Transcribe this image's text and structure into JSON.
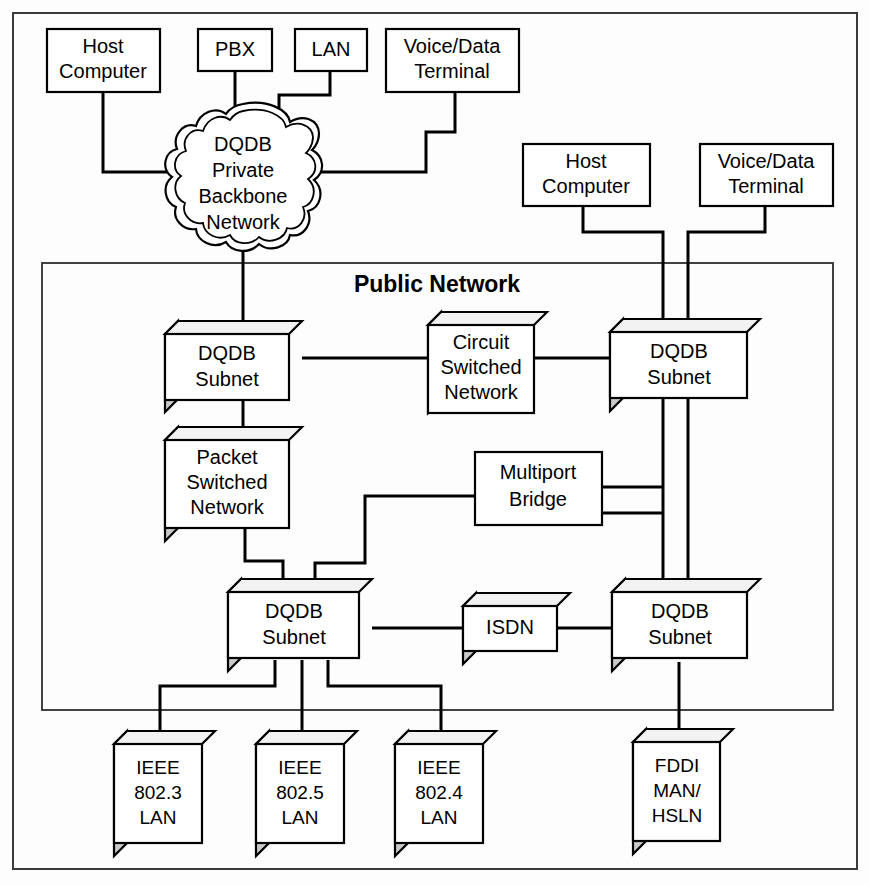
{
  "diagram": {
    "section_label": "Public Network",
    "nodes": {
      "host_computer_top": "Host\nComputer",
      "pbx": "PBX",
      "lan": "LAN",
      "voice_data_terminal_top": "Voice/Data\nTerminal",
      "dqdb_private_backbone": "DQDB\nPrivate\nBackbone\nNetwork",
      "host_computer_right": "Host\nComputer",
      "voice_data_terminal_right": "Voice/Data\nTerminal",
      "dqdb_subnet_1": "DQDB\nSubnet",
      "circuit_switched_network": "Circuit\nSwitched\nNetwork",
      "dqdb_subnet_2": "DQDB\nSubnet",
      "packet_switched_network": "Packet\nSwitched\nNetwork",
      "multiport_bridge": "Multiport\nBridge",
      "dqdb_subnet_3": "DQDB\nSubnet",
      "isdn": "ISDN",
      "dqdb_subnet_4": "DQDB\nSubnet",
      "ieee_802_3_lan": "IEEE\n802.3\nLAN",
      "ieee_802_5_lan": "IEEE\n802.5\nLAN",
      "ieee_802_4_lan": "IEEE\n802.4\nLAN",
      "fddi_man_hsln": "FDDI\nMAN/\nHSLN"
    },
    "node_lines": {
      "host_computer_top": [
        "Host",
        "Computer"
      ],
      "pbx": [
        "PBX"
      ],
      "lan": [
        "LAN"
      ],
      "voice_data_terminal_top": [
        "Voice/Data",
        "Terminal"
      ],
      "dqdb_private_backbone": [
        "DQDB",
        "Private",
        "Backbone",
        "Network"
      ],
      "host_computer_right": [
        "Host",
        "Computer"
      ],
      "voice_data_terminal_right": [
        "Voice/Data",
        "Terminal"
      ],
      "dqdb_subnet_1": [
        "DQDB",
        "Subnet"
      ],
      "circuit_switched_network": [
        "Circuit",
        "Switched",
        "Network"
      ],
      "dqdb_subnet_2": [
        "DQDB",
        "Subnet"
      ],
      "packet_switched_network": [
        "Packet",
        "Switched",
        "Network"
      ],
      "multiport_bridge": [
        "Multiport",
        "Bridge"
      ],
      "dqdb_subnet_3": [
        "DQDB",
        "Subnet"
      ],
      "isdn": [
        "ISDN"
      ],
      "dqdb_subnet_4": [
        "DQDB",
        "Subnet"
      ],
      "ieee_802_3_lan": [
        "IEEE",
        "802.3",
        "LAN"
      ],
      "ieee_802_5_lan": [
        "IEEE",
        "802.5",
        "LAN"
      ],
      "ieee_802_4_lan": [
        "IEEE",
        "802.4",
        "LAN"
      ],
      "fddi_man_hsln": [
        "FDDI",
        "MAN/",
        "HSLN"
      ]
    },
    "colors": {
      "line": "#000000",
      "box_fill": "#ffffff",
      "box_side_shade": "#c9c9c9",
      "box_top_shade": "#f2f2f2",
      "frame": "#3a3a3a",
      "background": "#fdfdfd"
    }
  }
}
